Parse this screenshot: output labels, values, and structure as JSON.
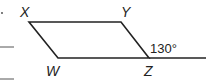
{
  "diagram": {
    "type": "parallelogram",
    "vertices": {
      "X": {
        "label": "X",
        "x": 29,
        "y": 22
      },
      "Y": {
        "label": "Y",
        "x": 121,
        "y": 22
      },
      "Z": {
        "label": "Z",
        "x": 149,
        "y": 58
      },
      "W": {
        "label": "W",
        "x": 58,
        "y": 58
      }
    },
    "extension_line_end": {
      "x": 206,
      "y": 58
    },
    "exterior_angle": {
      "label": "130°",
      "at": "Z"
    },
    "stroke_color": "#222222"
  }
}
